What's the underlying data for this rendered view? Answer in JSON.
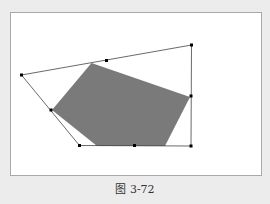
{
  "figure": {
    "caption": "图 3-72",
    "colors": {
      "background": "#ececec",
      "frame_fill": "#ffffff",
      "frame_border": "#a9a9a9",
      "hull_stroke": "#444444",
      "shape_fill": "#7a7a7a",
      "point_fill": "#000000"
    },
    "hull_points": [
      [
        21.5,
        75
      ],
      [
        106.5,
        60.5
      ],
      [
        191.5,
        45
      ],
      [
        191,
        96
      ],
      [
        191,
        146
      ],
      [
        134.5,
        145.5
      ],
      [
        79.5,
        145.5
      ],
      [
        51,
        110
      ]
    ],
    "hull_outline": [
      [
        21.5,
        75
      ],
      [
        191.5,
        45
      ],
      [
        191,
        146
      ],
      [
        79.5,
        145.5
      ]
    ],
    "gray_shape": [
      [
        91.5,
        63
      ],
      [
        190,
        97
      ],
      [
        165,
        146
      ],
      [
        97,
        146
      ],
      [
        52,
        110
      ]
    ]
  }
}
